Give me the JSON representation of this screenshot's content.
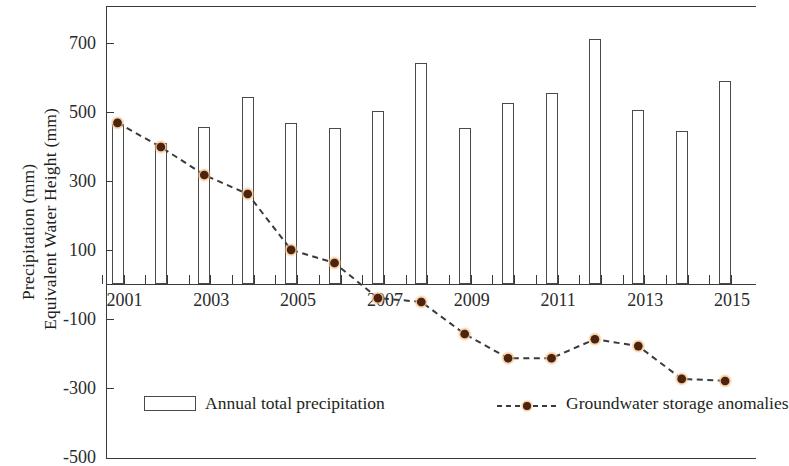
{
  "chart_data": {
    "type": "bar",
    "title": "",
    "subtitle": "",
    "xlabel": "",
    "ylabel": "Precipitation (mm) / Equivalent Water Height (mm)",
    "ylabel_lines": [
      "Precipitation (mm)",
      "Equivalent Water Height (mm)"
    ],
    "ylim": [
      -500,
      800
    ],
    "yticks": [
      700,
      500,
      300,
      100,
      -100,
      -300,
      -500
    ],
    "ytick_labels": [
      "700",
      "500",
      "300",
      "100",
      "-100",
      "-300",
      "-500"
    ],
    "grid": false,
    "legend_position": "bottom",
    "x": [
      2001,
      2002,
      2003,
      2004,
      2005,
      2006,
      2007,
      2008,
      2009,
      2010,
      2011,
      2012,
      2013,
      2014,
      2015
    ],
    "categories": [
      "2001",
      "2002",
      "2003",
      "2004",
      "2005",
      "2006",
      "2007",
      "2008",
      "2009",
      "2010",
      "2011",
      "2012",
      "2013",
      "2014",
      "2015"
    ],
    "xtick_labels_shown": [
      "2001",
      "2003",
      "2005",
      "2007",
      "2009",
      "2011",
      "2013",
      "2015"
    ],
    "series": [
      {
        "name": "Annual total precipitation",
        "type": "bar",
        "color": "#ffffff",
        "edge_color": "#4a4a4a",
        "values": [
          465,
          410,
          455,
          542,
          467,
          452,
          501,
          641,
          452,
          525,
          554,
          710,
          504,
          443,
          588
        ]
      },
      {
        "name": "Groundwater storage anomalies",
        "type": "line",
        "line_style": "dashed",
        "color": "#3a3a3a",
        "marker": "circle",
        "marker_color": "#4a2410",
        "marker_halo_color": "#f2c08a",
        "values": [
          467,
          397,
          316,
          261,
          99,
          61,
          -41,
          -52,
          -145,
          -215,
          -215,
          -160,
          -180,
          -275,
          -281
        ]
      }
    ]
  },
  "legend": {
    "items": [
      {
        "label": "Annual total precipitation",
        "swatch": "bar-outline-swatch"
      },
      {
        "label": "Groundwater storage anomalies",
        "swatch": "dashed-line-marker-swatch"
      }
    ]
  }
}
